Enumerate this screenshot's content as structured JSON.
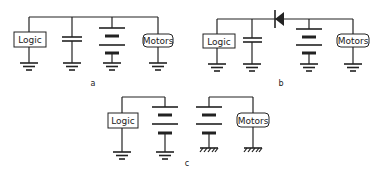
{
  "figure": {
    "panels": [
      {
        "label": "a",
        "components": {
          "logic": "Logic",
          "motors": "Motors"
        },
        "description": "Logic, capacitor, battery and motors in parallel on shared supply rail, all to common ground"
      },
      {
        "label": "b",
        "components": {
          "logic": "Logic",
          "motors": "Motors"
        },
        "description": "Diode isolates logic and capacitor from battery and motors; common ground"
      },
      {
        "label": "c",
        "components": {
          "logic": "Logic",
          "motors": "Motors"
        },
        "description": "Separate batteries: logic battery with signal ground, motor battery with chassis ground"
      }
    ],
    "icons": [
      "ground-icon",
      "chassis-ground-icon",
      "capacitor-icon",
      "battery-icon",
      "diode-icon"
    ],
    "stroke_color": "#222222",
    "background": "#ffffff"
  }
}
